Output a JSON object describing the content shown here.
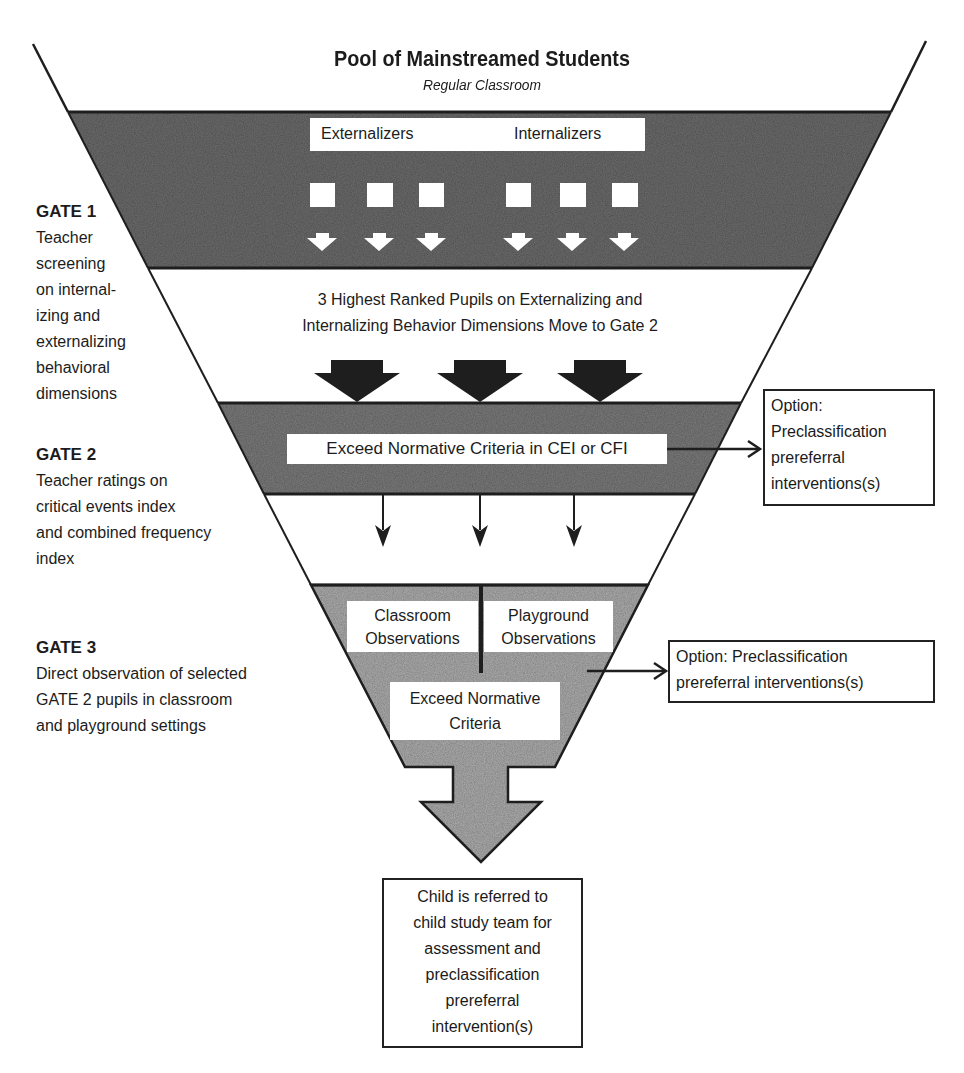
{
  "header": {
    "title": "Pool of Mainstreamed Students",
    "subtitle": "Regular Classroom"
  },
  "gate1_band": {
    "labels": [
      "Externalizers",
      "Internalizers"
    ],
    "square_count": 6,
    "arrow_count": 6
  },
  "transition1": {
    "text_line1": "3 Highest Ranked Pupils on Externalizing and",
    "text_line2": "Internalizing Behavior Dimensions Move to Gate 2",
    "arrow_count": 3
  },
  "gate2_band": {
    "label": "Exceed Normative Criteria in CEI or CFI",
    "arrow_count": 3
  },
  "gate3_band": {
    "left_label_line1": "Classroom",
    "left_label_line2": "Observations",
    "right_label_line1": "Playground",
    "right_label_line2": "Observations",
    "bottom_label_line1": "Exceed Normative",
    "bottom_label_line2": "Criteria"
  },
  "gates": [
    {
      "heading": "GATE 1",
      "description": [
        "Teacher",
        "screening",
        "on internal-",
        "izing and",
        "externalizing",
        "behavioral",
        "dimensions"
      ]
    },
    {
      "heading": "GATE 2",
      "description": [
        "Teacher ratings on",
        "critical events index",
        "and combined frequency",
        "index"
      ]
    },
    {
      "heading": "GATE 3",
      "description": [
        "Direct observation of selected",
        "GATE 2 pupils in classroom",
        "and playground settings"
      ]
    }
  ],
  "options": [
    {
      "lines": [
        "Option:",
        "Preclassification",
        "prereferral",
        "interventions(s)"
      ]
    },
    {
      "lines": [
        "Option: Preclassification",
        "prereferral interventions(s)"
      ]
    }
  ],
  "outcome": {
    "lines": [
      "Child is referred to",
      "child study team for",
      "assessment and",
      "preclassification",
      "prereferral",
      "intervention(s)"
    ]
  },
  "colors": {
    "dark_band": "#6e6e6e",
    "mid_band": "#8a8a8a",
    "light_band": "#b5b5b5",
    "line": "#1e1e1e"
  }
}
